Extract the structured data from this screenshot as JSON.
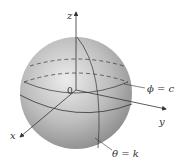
{
  "diagram": {
    "labels": {
      "z_axis": "z",
      "x_axis": "x",
      "y_axis": "y",
      "origin": "0",
      "phi_surface": "ϕ = c",
      "theta_surface": "θ = k"
    },
    "colors": {
      "sphere_light": "#e4e4e4",
      "sphere_dark": "#8a8a8a",
      "line": "#333333"
    }
  }
}
